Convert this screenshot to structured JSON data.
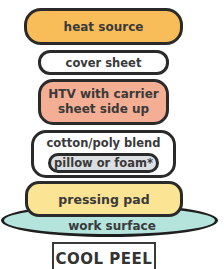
{
  "diagram": {
    "layers": [
      {
        "id": "heat",
        "label": "heat source",
        "color": "#f8bc58"
      },
      {
        "id": "cover",
        "label": "cover sheet",
        "color": "#ffffff"
      },
      {
        "id": "htv",
        "label_line1": "HTV with carrier",
        "label_line2": "sheet side up",
        "color": "#f4ae93"
      },
      {
        "id": "cotton",
        "label": "cotton/poly blend",
        "color": "#ffffff"
      },
      {
        "id": "pillow",
        "label": "pillow or foam*",
        "color": "#dcdfe2"
      },
      {
        "id": "pad",
        "label": "pressing pad",
        "color": "#fbe493"
      },
      {
        "id": "work",
        "label": "work surface",
        "color": "#b4e4dc"
      }
    ],
    "peel_type": "COOL PEEL",
    "border_color": "#2a2a2a"
  }
}
